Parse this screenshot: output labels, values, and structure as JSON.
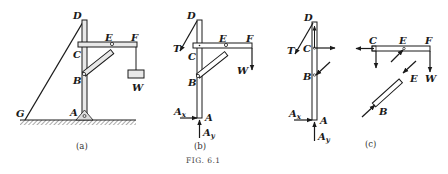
{
  "figure": {
    "caption": "Fig. 6.1",
    "caption_display": "FIG. 6.1",
    "panels": {
      "a": {
        "caption": "(a)",
        "labels": {
          "D": "D",
          "E": "E",
          "F": "F",
          "C": "C",
          "B": "B",
          "W": "W",
          "A": "A",
          "G": "G"
        }
      },
      "b": {
        "caption": "(b)",
        "labels": {
          "D": "D",
          "T": "T",
          "E": "E",
          "F": "F",
          "C": "C",
          "B": "B",
          "W": "W",
          "Ax": "A",
          "Ax_sub": "x",
          "A": "A",
          "Ay": "A",
          "Ay_sub": "y"
        }
      },
      "c": {
        "caption": "(c)",
        "labels": {
          "D": "D",
          "T": "T",
          "C1": "C",
          "B1": "B",
          "Ax": "A",
          "Ax_sub": "x",
          "A": "A",
          "Ay": "A",
          "Ay_sub": "y",
          "C2": "C",
          "E1": "E",
          "F": "F",
          "W": "W",
          "E2": "E",
          "B2": "B"
        }
      }
    }
  },
  "colors": {
    "ink": "#1a1a1a",
    "member_fill": "#e8e8e8",
    "ground": "#555555"
  }
}
